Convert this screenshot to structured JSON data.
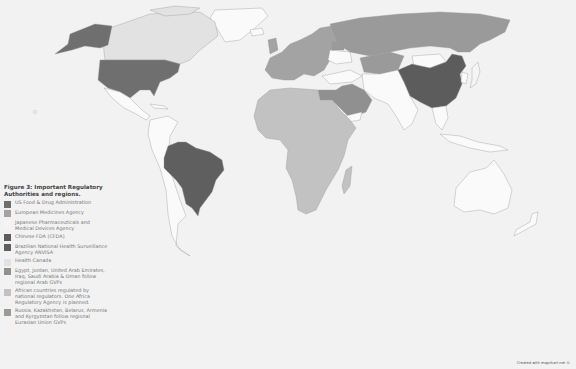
{
  "map": {
    "background_color": "#f2f2f2",
    "ocean_color": "#f2f2f2",
    "default_land_color": "#fafafa",
    "border_color": "#9a9a9a"
  },
  "legend": {
    "title": "Figure 3: Important Regulatory Authorities and regions.",
    "items": [
      {
        "label": "US Food & Drug Administration",
        "color": "#6f6f6f"
      },
      {
        "label": "European Medicines Agency",
        "color": "#a3a3a3"
      },
      {
        "label": "Japanese Pharmaceuticals and Medical Devices Agency",
        "color": "#f4f4f4"
      },
      {
        "label": "Chinese FDA (CFDA)",
        "color": "#5c5c5c"
      },
      {
        "label": "Brazilian National Health Surveillance Agency ANVISA",
        "color": "#5f5f5f"
      },
      {
        "label": "Health Canada",
        "color": "#e2e2e2"
      },
      {
        "label": "Egypt, Jordan, United Arab Emirates, Iraq, Saudi Arabia & Oman follow regional Arab GVPs",
        "color": "#909090"
      },
      {
        "label": "African countries regulated by national regulators. One Africa Regulatory Agency is planned.",
        "color": "#c2c2c2"
      },
      {
        "label": "Russia, Kazakhstan, Belarus, Armenia and Kyrgyzstan follow regional Eurasian Union GVPs",
        "color": "#9a9a9a"
      }
    ]
  },
  "credit": "Created with mapchart.net ©"
}
